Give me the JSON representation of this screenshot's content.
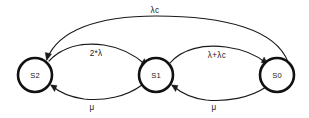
{
  "diagram": {
    "type": "state-transition-diagram",
    "title": "",
    "background_color": "#ffffff",
    "stroke_color": "#1a1a1a",
    "node_stroke_color": "#111111",
    "node_fill_color": "#ffffff",
    "nodes": [
      {
        "id": "S2",
        "label": "S2",
        "cx": 35,
        "cy": 75,
        "r": 17
      },
      {
        "id": "S1",
        "label": "S1",
        "cx": 156,
        "cy": 75,
        "r": 17
      },
      {
        "id": "S0",
        "label": "S0",
        "cx": 277,
        "cy": 75,
        "r": 17
      }
    ],
    "edges": [
      {
        "id": "e-s0-s2-top",
        "from": "S0",
        "to": "S2",
        "label": "λc",
        "label_x": 155,
        "label_y": 11,
        "position": "top-arc"
      },
      {
        "id": "e-s2-s1",
        "from": "S2",
        "to": "S1",
        "label": "2*λ",
        "label_x": 96,
        "label_y": 54,
        "position": "upper-left-arc"
      },
      {
        "id": "e-s1-s0",
        "from": "S1",
        "to": "S0",
        "label": "λ+λc",
        "label_x": 217,
        "label_y": 56,
        "position": "upper-right-arc"
      },
      {
        "id": "e-s1-s2",
        "from": "S1",
        "to": "S2",
        "label": "μ",
        "label_x": 92,
        "label_y": 108,
        "position": "lower-left-arc"
      },
      {
        "id": "e-s0-s1",
        "from": "S0",
        "to": "S1",
        "label": "μ",
        "label_x": 214,
        "label_y": 108,
        "position": "lower-right-arc"
      }
    ]
  }
}
